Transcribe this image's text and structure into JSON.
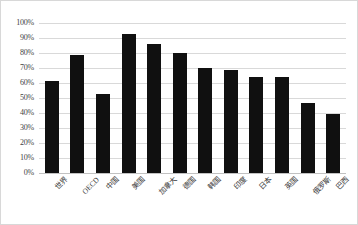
{
  "chart_data": {
    "type": "bar",
    "title": "",
    "subtitle": "",
    "xlabel": "",
    "ylabel": "",
    "ylim": [
      0,
      100
    ],
    "yunit": "%",
    "grid": true,
    "legend": false,
    "orientation": "vertical",
    "bar_color": "#101010",
    "gridline_color": "#d9d9d9",
    "background_color": "#ffffff",
    "categories": [
      "世界",
      "OECD",
      "中国",
      "美国",
      "加拿大",
      "德国",
      "韩国",
      "印度",
      "日本",
      "英国",
      "俄罗斯",
      "巴西"
    ],
    "values": [
      61.5,
      79,
      53,
      93,
      86,
      80,
      70,
      68.5,
      64,
      64,
      47,
      39.5
    ],
    "ytick_labels": [
      "100%",
      "90%",
      "80%",
      "70%",
      "60%",
      "50%",
      "40%",
      "30%",
      "20%",
      "10%",
      "0%"
    ],
    "ytick_values": [
      100,
      90,
      80,
      70,
      60,
      50,
      40,
      30,
      20,
      10,
      0
    ]
  }
}
